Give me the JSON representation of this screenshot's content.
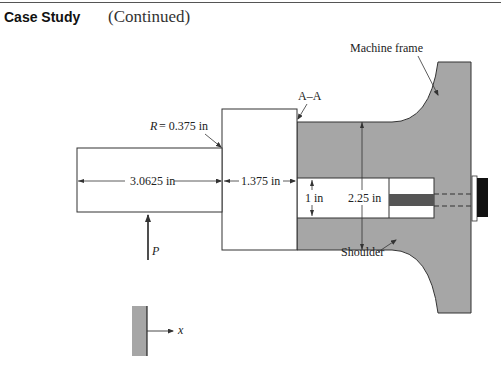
{
  "header": {
    "title": "Case Study",
    "subtitle": "(Continued)"
  },
  "diagram": {
    "labels": {
      "machine_frame": "Machine frame",
      "section": "A–A",
      "radius": "= 0.375 in",
      "radius_symbol": "R",
      "shaft_length": "3.0625 in",
      "block_length": "1.375 in",
      "bore_diameter": "1 in",
      "outer_diameter": "2.25 in",
      "shoulder": "Shoulder",
      "force": "P",
      "axis": "x"
    },
    "colors": {
      "frame_fill": "#a6a6a6",
      "rod_fill": "#555555",
      "bolt_fill": "#111111",
      "line": "#333333"
    }
  }
}
